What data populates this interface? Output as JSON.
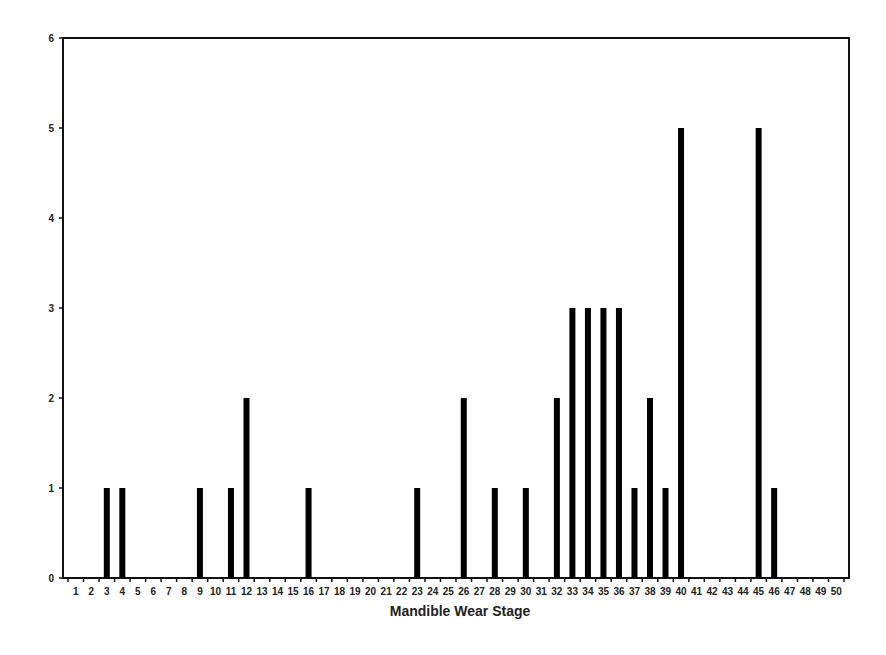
{
  "chart_data": {
    "type": "bar",
    "title": "",
    "xlabel": "Mandible Wear Stage",
    "ylabel": "",
    "ylim": [
      0,
      6
    ],
    "yticks": [
      0,
      1,
      2,
      3,
      4,
      5,
      6
    ],
    "grid": false,
    "legend": null,
    "categories": [
      "1",
      "2",
      "3",
      "4",
      "5",
      "6",
      "7",
      "8",
      "9",
      "10",
      "11",
      "12",
      "13",
      "14",
      "15",
      "16",
      "17",
      "18",
      "19",
      "20",
      "21",
      "22",
      "23",
      "24",
      "25",
      "26",
      "27",
      "28",
      "29",
      "30",
      "31",
      "32",
      "33",
      "34",
      "35",
      "36",
      "37",
      "38",
      "39",
      "40",
      "41",
      "42",
      "43",
      "44",
      "45",
      "46",
      "47",
      "48",
      "49",
      "50"
    ],
    "values": [
      0,
      0,
      1,
      1,
      0,
      0,
      0,
      0,
      1,
      0,
      1,
      2,
      0,
      0,
      0,
      1,
      0,
      0,
      0,
      0,
      0,
      0,
      1,
      0,
      0,
      2,
      0,
      1,
      0,
      1,
      0,
      2,
      3,
      3,
      3,
      3,
      1,
      2,
      1,
      5,
      0,
      0,
      0,
      0,
      5,
      1,
      0,
      0,
      0,
      0
    ],
    "bar_color": "#000000"
  }
}
